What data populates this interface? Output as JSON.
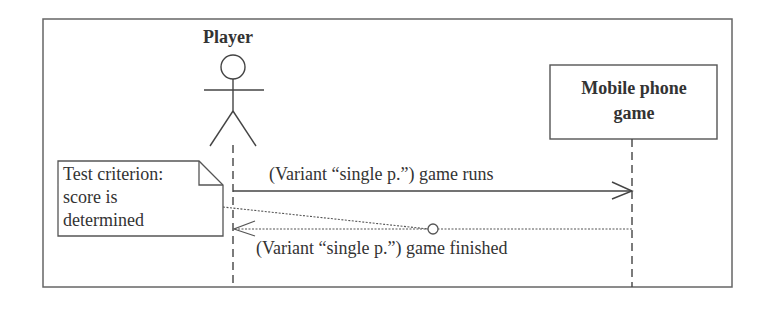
{
  "diagram": {
    "type": "UML sequence diagram",
    "actor": {
      "name": "Player"
    },
    "object": {
      "name_line1": "Mobile phone",
      "name_line2": "game",
      "name": "Mobile phone game"
    },
    "note": {
      "line1": "Test criterion:",
      "line2": "score is",
      "line3": "determined",
      "text": "Test criterion: score is determined"
    },
    "messages": [
      {
        "label": "(Variant “single p.”) game runs",
        "from": "Player",
        "to": "Mobile phone game",
        "style": "solid, open arrowhead"
      },
      {
        "label": "(Variant “single p.”) game finished",
        "from": "Mobile phone game",
        "to": "Player",
        "style": "dotted return, open arrowhead"
      }
    ],
    "colors": {
      "line": "#555555",
      "text": "#333333",
      "background": "#ffffff"
    }
  }
}
